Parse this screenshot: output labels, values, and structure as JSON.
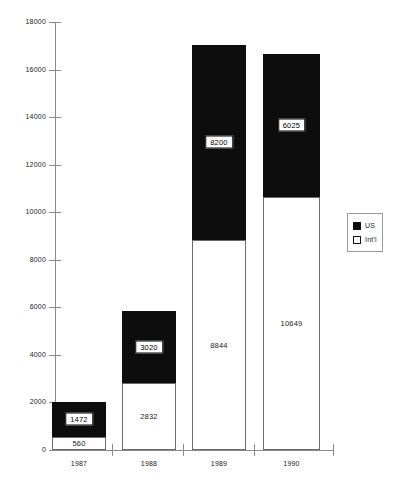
{
  "chart_data": {
    "type": "bar",
    "subtype": "stacked-vertical",
    "title": "",
    "xlabel": "",
    "ylabel": "",
    "categories": [
      "1987",
      "1988",
      "1989",
      "1990"
    ],
    "series": [
      {
        "name": "Int'l",
        "key": "intl",
        "color": "#ffffff",
        "values": [
          560,
          2832,
          8844,
          10649
        ]
      },
      {
        "name": "US",
        "key": "us",
        "color": "#0d0d0d",
        "values": [
          1472,
          3020,
          8200,
          6025
        ]
      }
    ],
    "totals": [
      2032,
      5852,
      17044,
      16674
    ],
    "ylim": [
      0,
      18000
    ],
    "yticks": [
      0,
      2000,
      4000,
      6000,
      8000,
      10000,
      12000,
      14000,
      16000,
      18000
    ],
    "ytick_labels": [
      "0",
      "2000",
      "4000",
      "6000",
      "8000",
      "10000",
      "12000",
      "14000",
      "16000",
      "18000"
    ],
    "grid": false,
    "legend": {
      "position": "right",
      "entries": [
        {
          "label": "US",
          "swatch": "us"
        },
        {
          "label": "Int'l",
          "swatch": "intl"
        }
      ]
    },
    "data_labels": [
      {
        "category": "1987",
        "series": "US",
        "text": "1472",
        "style": "boxed"
      },
      {
        "category": "1987",
        "series": "Int'l",
        "text": "560",
        "style": "plain"
      },
      {
        "category": "1988",
        "series": "US",
        "text": "3020",
        "style": "boxed"
      },
      {
        "category": "1988",
        "series": "Int'l",
        "text": "2832",
        "style": "plain"
      },
      {
        "category": "1989",
        "series": "US",
        "text": "8200",
        "style": "boxed"
      },
      {
        "category": "1989",
        "series": "Int'l",
        "text": "8844",
        "style": "plain"
      },
      {
        "category": "1990",
        "series": "US",
        "text": "6025",
        "style": "boxed"
      },
      {
        "category": "1990",
        "series": "Int'l",
        "text": "10649",
        "style": "plain"
      }
    ]
  },
  "axes": {
    "plot": {
      "left": 55,
      "top": 22,
      "width": 278,
      "height": 428
    },
    "bars": [
      {
        "category": "1987",
        "left": 52,
        "width": 54
      },
      {
        "category": "1988",
        "left": 122,
        "width": 54
      },
      {
        "category": "1989",
        "left": 192,
        "width": 54
      },
      {
        "category": "1990",
        "left": 263,
        "width": 57
      }
    ],
    "xtick_positions": [
      112,
      183,
      254,
      333
    ]
  }
}
